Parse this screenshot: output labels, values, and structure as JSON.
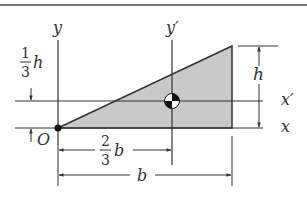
{
  "figure": {
    "colors": {
      "line": "#333333",
      "fill": "#c9c9c9",
      "border": "#777777",
      "background": "#ffffff"
    }
  },
  "axes": {
    "x_label": "x",
    "x_prime_label": "x′",
    "y_label": "y",
    "y_prime_label": "y′",
    "origin_label": "O"
  },
  "dimensions": {
    "height_label": "h",
    "third_h": {
      "numerator": "1",
      "denominator": "3",
      "var": "h"
    },
    "two_thirds_b": {
      "numerator": "2",
      "denominator": "3",
      "var": "b"
    },
    "base_label": "b"
  },
  "centroid": {
    "icon": "centroid-symbol"
  }
}
